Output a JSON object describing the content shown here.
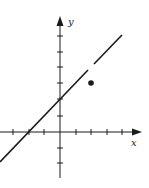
{
  "graph": {
    "x_axis_label": "x",
    "y_axis_label": "y",
    "line_color": "#1a1a1a",
    "line_equation": "y = x + 2",
    "hole_at": [
      2,
      4
    ],
    "filled_point": [
      2,
      3
    ],
    "x_ticks": [
      -4,
      -3,
      -2,
      -1,
      1,
      2,
      3,
      4
    ],
    "y_ticks": [
      -2,
      -1,
      1,
      2,
      3,
      4,
      5,
      6
    ]
  }
}
